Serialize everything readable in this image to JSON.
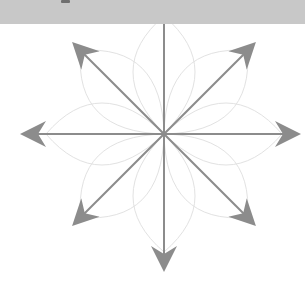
{
  "canvas": {
    "width": 305,
    "height": 286,
    "background_color": "#ffffff"
  },
  "header": {
    "height": 24,
    "color": "#c8c8c8",
    "speck": {
      "x": 61,
      "y": 0,
      "width": 9,
      "height": 3,
      "color": "#6f6f6f"
    }
  },
  "figure": {
    "kind": "radial-arrow-star",
    "center": {
      "x": 164,
      "y": 134
    },
    "arrow_color": "#8c8c8c",
    "arrow_shaft_width": 2,
    "arc_color": "#e2e2e2",
    "arc_width": 1,
    "arrow_count": 8,
    "arc_count": 8,
    "arrow_head_length": 26,
    "arrow_head_half_width": 13,
    "arrow_head_notch": 8,
    "arrows": [
      {
        "name": "arrow-east",
        "angle_deg": 0,
        "label": "E",
        "length": 137,
        "tip": {
          "x": 301,
          "y": 134
        }
      },
      {
        "name": "arrow-northeast",
        "angle_deg": 45,
        "label": "NE",
        "length": 130,
        "tip": {
          "x": 256,
          "y": 42
        }
      },
      {
        "name": "arrow-north",
        "angle_deg": 90,
        "label": "N",
        "length": 140,
        "tip": {
          "x": 164,
          "y": -6
        }
      },
      {
        "name": "arrow-northwest",
        "angle_deg": 135,
        "label": "NW",
        "length": 130,
        "tip": {
          "x": 72,
          "y": 42
        }
      },
      {
        "name": "arrow-west",
        "angle_deg": 180,
        "label": "W",
        "length": 144,
        "tip": {
          "x": 20,
          "y": 134
        }
      },
      {
        "name": "arrow-southwest",
        "angle_deg": 225,
        "label": "SW",
        "length": 130,
        "tip": {
          "x": 72,
          "y": 226
        }
      },
      {
        "name": "arrow-south",
        "angle_deg": 270,
        "label": "S",
        "length": 138,
        "tip": {
          "x": 164,
          "y": 272
        }
      },
      {
        "name": "arrow-southeast",
        "angle_deg": 315,
        "label": "SE",
        "length": 130,
        "tip": {
          "x": 256,
          "y": 226
        }
      }
    ],
    "arcs": {
      "radius": 118,
      "bulge": 62,
      "description": "eight faint circular arcs from center to each arrow direction forming a rosette",
      "angles_deg": [
        0,
        45,
        90,
        135,
        180,
        225,
        270,
        315
      ]
    }
  }
}
